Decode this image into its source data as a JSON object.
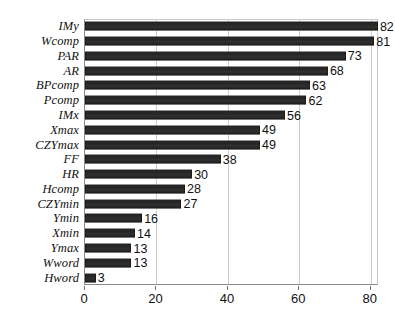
{
  "chart_data": {
    "type": "bar",
    "orientation": "horizontal",
    "title": "",
    "subtitle": "",
    "xlabel": "",
    "ylabel": "",
    "xlim": [
      0,
      82.3
    ],
    "ylim": null,
    "grid": true,
    "grid_axis": "x",
    "legend": null,
    "legend_position": "none",
    "xticks": [
      0,
      20,
      40,
      60,
      80
    ],
    "xticklabels": [
      "0",
      "20",
      "40",
      "60",
      "80"
    ],
    "categories": [
      "IMy",
      "Wcomp",
      "PAR",
      "AR",
      "BPcomp",
      "Pcomp",
      "IMx",
      "Xmax",
      "CZYmax",
      "FF",
      "HR",
      "Hcomp",
      "CZYmin",
      "Ymin",
      "Xmin",
      "Ymax",
      "Wword",
      "Hword"
    ],
    "values": [
      82,
      81,
      73,
      68,
      63,
      62,
      56,
      49,
      49,
      38,
      30,
      28,
      27,
      16,
      14,
      13,
      13,
      3
    ],
    "value_labels": [
      "82",
      "81",
      "73",
      "68",
      "63",
      "62",
      "56",
      "49",
      "49",
      "38",
      "30",
      "28",
      "27",
      "16",
      "14",
      "13",
      "13",
      "3"
    ],
    "series": [
      {
        "name": "",
        "values": [
          82,
          81,
          73,
          68,
          63,
          62,
          56,
          49,
          49,
          38,
          30,
          28,
          27,
          16,
          14,
          13,
          13,
          3
        ]
      }
    ],
    "colors": {
      "bar": "#242424",
      "axis": "#8a8a8a",
      "grid": "#cdcdcd",
      "text": "#111111",
      "background": "#ffffff"
    }
  }
}
